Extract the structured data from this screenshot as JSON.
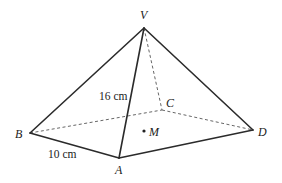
{
  "diagram": {
    "type": "square-based pyramid",
    "colors": {
      "line": "#2b2b2b",
      "hidden": "#555555",
      "text": "#222222"
    },
    "vertices": {
      "V": {
        "label": "V",
        "x": 144,
        "y": 28
      },
      "A": {
        "label": "A",
        "x": 119,
        "y": 158
      },
      "B": {
        "label": "B",
        "x": 30,
        "y": 133
      },
      "C": {
        "label": "C",
        "x": 162,
        "y": 110
      },
      "D": {
        "label": "D",
        "x": 253,
        "y": 130
      }
    },
    "center": {
      "label": "M",
      "x": 144,
      "y": 131
    },
    "visible_edges": [
      [
        "V",
        "B"
      ],
      [
        "V",
        "A"
      ],
      [
        "V",
        "D"
      ],
      [
        "B",
        "A"
      ],
      [
        "A",
        "D"
      ]
    ],
    "hidden_edges": [
      [
        "V",
        "C"
      ],
      [
        "B",
        "C"
      ],
      [
        "C",
        "D"
      ]
    ],
    "measurements": {
      "edge_VA": "16 cm",
      "edge_AB": "10 cm"
    }
  }
}
